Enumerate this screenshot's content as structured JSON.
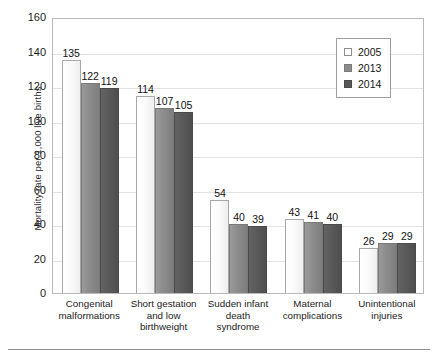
{
  "chart_data": {
    "type": "bar",
    "title": "",
    "xlabel": "",
    "ylabel": "Mortality rate per 1,000 live births",
    "ylim": [
      0,
      160
    ],
    "ytick_step": 20,
    "yticks": [
      0,
      20,
      40,
      60,
      80,
      100,
      120,
      140,
      160
    ],
    "grid": true,
    "legend_position": "top-right",
    "categories": [
      "Congenital malformations",
      "Short gestation and low birthweight",
      "Sudden infant death syndrome",
      "Maternal complications",
      "Unintentional injuries"
    ],
    "category_lines": [
      [
        "Congenital",
        "malformations"
      ],
      [
        "Short gestation",
        "and low",
        "birthweight"
      ],
      [
        "Sudden infant",
        "death",
        "syndrome"
      ],
      [
        "Maternal",
        "complications"
      ],
      [
        "Unintentional",
        "injuries"
      ]
    ],
    "series": [
      {
        "name": "2005",
        "color": "#fcfcfc",
        "values": [
          135,
          114,
          54,
          43,
          26
        ]
      },
      {
        "name": "2013",
        "color": "#8b8b8b",
        "values": [
          122,
          107,
          40,
          41,
          29
        ]
      },
      {
        "name": "2014",
        "color": "#565656",
        "values": [
          119,
          105,
          39,
          40,
          29
        ]
      }
    ]
  },
  "legend": {
    "items": [
      {
        "label": "2005"
      },
      {
        "label": "2013"
      },
      {
        "label": "2014"
      }
    ]
  }
}
